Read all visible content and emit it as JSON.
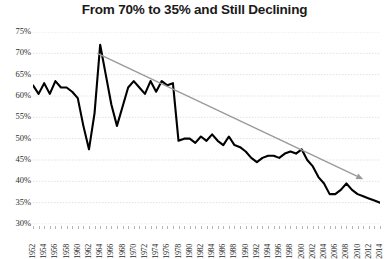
{
  "chart_data": {
    "type": "line",
    "title": "From 70% to 35% and Still Declining",
    "xlabel": "",
    "ylabel": "",
    "ylim": [
      30,
      75
    ],
    "xlim": [
      1952,
      2014
    ],
    "ytick_step": 5,
    "grid": true,
    "legend": "none",
    "y_ticks": [
      "75%",
      "70%",
      "65%",
      "60%",
      "55%",
      "50%",
      "45%",
      "40%",
      "35%",
      "30%"
    ],
    "y_tick_values": [
      75,
      70,
      65,
      60,
      55,
      50,
      45,
      40,
      35,
      30
    ],
    "x_ticks": [
      "1952",
      "1954",
      "1956",
      "1958",
      "1960",
      "1962",
      "1964",
      "1966",
      "1968",
      "1970",
      "1972",
      "1974",
      "1976",
      "1978",
      "1980",
      "1982",
      "1984",
      "1986",
      "1988",
      "1990",
      "1992",
      "1994",
      "1996",
      "1998",
      "2000",
      "2002",
      "2004",
      "2006",
      "2008",
      "2010",
      "2012",
      "2014"
    ],
    "x": [
      1952,
      1953,
      1954,
      1955,
      1956,
      1957,
      1958,
      1959,
      1960,
      1961,
      1962,
      1963,
      1964,
      1965,
      1966,
      1967,
      1968,
      1969,
      1970,
      1971,
      1972,
      1973,
      1974,
      1975,
      1976,
      1977,
      1978,
      1979,
      1980,
      1981,
      1982,
      1983,
      1984,
      1985,
      1986,
      1987,
      1988,
      1989,
      1990,
      1991,
      1992,
      1993,
      1994,
      1995,
      1996,
      1997,
      1998,
      1999,
      2000,
      2001,
      2002,
      2003,
      2004,
      2005,
      2006,
      2007,
      2008,
      2009,
      2010,
      2011,
      2012,
      2013,
      2014
    ],
    "values": [
      62.5,
      60.5,
      63.0,
      60.5,
      63.5,
      62.0,
      62.0,
      61.0,
      59.5,
      53.0,
      47.5,
      56.0,
      72.0,
      65.0,
      58.0,
      53.0,
      57.5,
      62.0,
      63.5,
      62.0,
      60.5,
      63.5,
      61.0,
      63.5,
      62.5,
      63.0,
      49.5,
      50.0,
      50.0,
      49.0,
      50.5,
      49.5,
      51.0,
      49.5,
      48.5,
      50.5,
      48.5,
      48.0,
      47.0,
      45.5,
      44.5,
      45.5,
      46.0,
      46.0,
      45.5,
      46.5,
      47.0,
      46.5,
      47.5,
      45.0,
      43.5,
      41.0,
      39.5,
      37.0,
      37.0,
      38.0,
      39.5,
      38.0,
      37.0,
      36.5,
      36.0,
      35.5,
      35.0
    ],
    "series_color": "#000000",
    "trendline": {
      "color": "#9a9a9a",
      "arrow": true,
      "start": {
        "x": 1963.5,
        "y": 70.0
      },
      "end": {
        "x": 2011.0,
        "y": 40.5
      }
    },
    "grid_color": "#d9d9d9",
    "background": "#ffffff"
  }
}
